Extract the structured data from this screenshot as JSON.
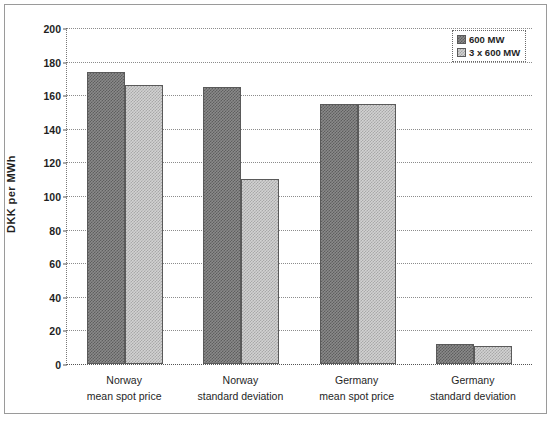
{
  "chart_data": {
    "type": "bar",
    "title": "",
    "xlabel": "",
    "ylabel": "DKK per MWh",
    "ylim": [
      0,
      200
    ],
    "ytick_step": 20,
    "yticks": [
      0,
      20,
      40,
      60,
      80,
      100,
      120,
      140,
      160,
      180,
      200
    ],
    "grid": true,
    "legend_position": "top-right",
    "categories": [
      {
        "line1": "Norway",
        "line2": "mean spot price"
      },
      {
        "line1": "Norway",
        "line2": "standard deviation"
      },
      {
        "line1": "Germany",
        "line2": "mean spot price"
      },
      {
        "line1": "Germany",
        "line2": "standard deviation"
      }
    ],
    "series": [
      {
        "name": "600 MW",
        "color": "#6e6e6e",
        "values": [
          174,
          165,
          155,
          12
        ]
      },
      {
        "name": "3 x 600 MW",
        "color": "#b8b8b8",
        "values": [
          166,
          110,
          155,
          11
        ]
      }
    ]
  },
  "legend": {
    "entries": [
      {
        "label": "600 MW"
      },
      {
        "label": "3 x 600 MW"
      }
    ]
  },
  "axis": {
    "y_title": "DKK per MWh"
  }
}
